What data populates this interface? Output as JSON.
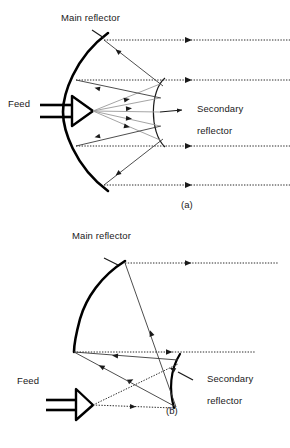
{
  "figure": {
    "title_a": "(a)",
    "title_b": "(b)"
  },
  "panel_a": {
    "caption": "(a)",
    "labels": {
      "main_reflector": "Main reflector",
      "feed": "Feed",
      "secondary_reflector_line1": "Secondary",
      "secondary_reflector_line2": "reflector"
    }
  },
  "panel_b": {
    "caption": "(b)",
    "labels": {
      "main_reflector": "Main reflector",
      "feed": "Feed",
      "secondary_reflector_line1": "Secondary",
      "secondary_reflector_line2": "reflector"
    }
  },
  "colors": {
    "ink": "#1a1a1a",
    "reflector_stroke": "#000000",
    "ray_stroke": "#3a3a3a",
    "dotted_ray_stroke": "#2b2b2b",
    "background": "#ffffff"
  }
}
